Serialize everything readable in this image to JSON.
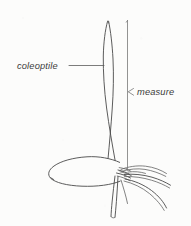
{
  "figure": {
    "kind": "botanical-line-drawing",
    "background_color": "#fcfcfb",
    "ink_color": "#4a4a4a",
    "labels": {
      "coleoptile": "coleoptile",
      "measure": "measure"
    },
    "annotations": {
      "coleoptile_leader": "horizontal leader line from label to coleoptile blade",
      "measure_bracket": "vertical bracket spanning coleoptile length",
      "measure_tick": "small arrow tick pointing left to bracket"
    },
    "parts": [
      "coleoptile-blade",
      "seed-endosperm",
      "root-node",
      "lateral-roots",
      "primary-root"
    ]
  }
}
